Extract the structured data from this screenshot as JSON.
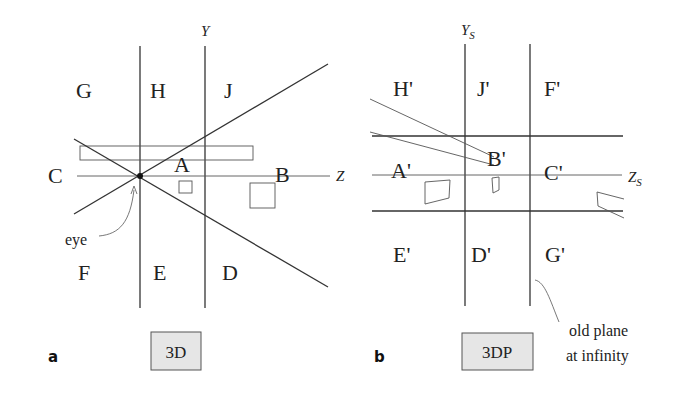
{
  "panel_a": {
    "panel_label": "a",
    "axis_y": "Y",
    "axis_z": "Z",
    "regions": {
      "G": "G",
      "H": "H",
      "J": "J",
      "C": "C",
      "A": "A",
      "B": "B",
      "F": "F",
      "E": "E",
      "D": "D"
    },
    "eye_label": "eye",
    "box_label": "3D"
  },
  "panel_b": {
    "panel_label": "b",
    "axis_y": "Y",
    "axis_y_sub": "S",
    "axis_z": "Z",
    "axis_z_sub": "S",
    "regions": {
      "H": "H'",
      "J": "J'",
      "F": "F'",
      "A": "A'",
      "B": "B'",
      "C": "C'",
      "E": "E'",
      "D": "D'",
      "G": "G'"
    },
    "note_line1": "old plane",
    "note_line2": "at infinity",
    "box_label": "3DP"
  },
  "colors": {
    "line": "#333333",
    "thin_line": "#555555",
    "box_fill": "#e6e6e6",
    "box_stroke": "#555555"
  }
}
